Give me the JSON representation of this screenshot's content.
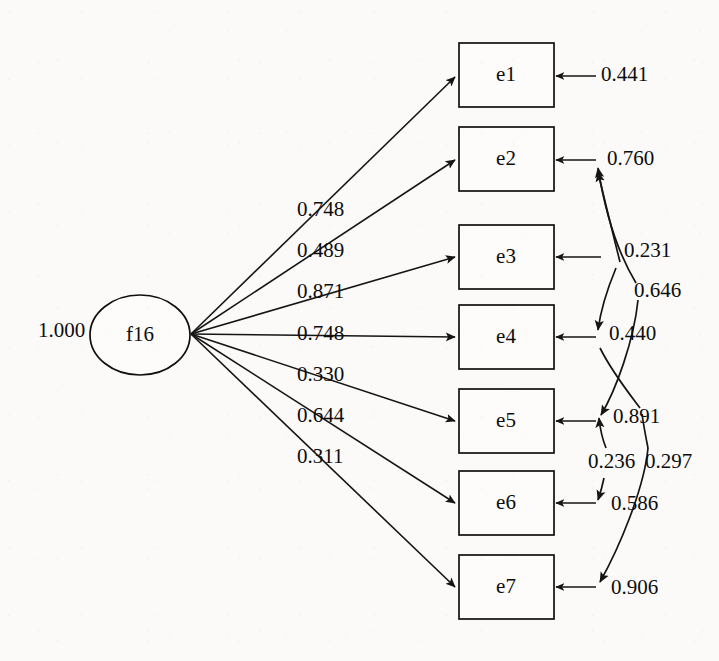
{
  "diagram": {
    "type": "sem-path-diagram",
    "title": "",
    "canvas": {
      "width": 719,
      "height": 661
    },
    "background_color": "#fbfaf8",
    "stroke_color": "#151515"
  },
  "latent": {
    "name": "f16",
    "shape": "ellipse",
    "cx": 140,
    "cy": 335,
    "rx": 50,
    "ry": 40,
    "variance_label": "1.000",
    "variance_label_x": 38,
    "variance_label_y": 332
  },
  "indicators": [
    {
      "name": "e1",
      "x": 459,
      "y": 43,
      "w": 95,
      "h": 64
    },
    {
      "name": "e2",
      "x": 459,
      "y": 127,
      "w": 95,
      "h": 64
    },
    {
      "name": "e3",
      "x": 459,
      "y": 225,
      "w": 95,
      "h": 64
    },
    {
      "name": "e4",
      "x": 459,
      "y": 305,
      "w": 95,
      "h": 64
    },
    {
      "name": "e5",
      "x": 459,
      "y": 389,
      "w": 95,
      "h": 64
    },
    {
      "name": "e6",
      "x": 459,
      "y": 471,
      "w": 95,
      "h": 64
    },
    {
      "name": "e7",
      "x": 459,
      "y": 555,
      "w": 95,
      "h": 64
    }
  ],
  "loadings": [
    {
      "target": "e1",
      "value": "0.748",
      "label_x": 297,
      "label_y": 211
    },
    {
      "target": "e2",
      "value": "0.489",
      "label_x": 297,
      "label_y": 252
    },
    {
      "target": "e3",
      "value": "0.871",
      "label_x": 297,
      "label_y": 293
    },
    {
      "target": "e4",
      "value": "0.748",
      "label_x": 297,
      "label_y": 335
    },
    {
      "target": "e5",
      "value": "0.330",
      "label_x": 297,
      "label_y": 376
    },
    {
      "target": "e6",
      "value": "0.644",
      "label_x": 297,
      "label_y": 417
    },
    {
      "target": "e7",
      "value": "0.311",
      "label_x": 297,
      "label_y": 458
    }
  ],
  "residuals": [
    {
      "target": "e1",
      "value": "0.441",
      "label_x": 601,
      "label_y": 76,
      "tail_x": 596
    },
    {
      "target": "e2",
      "value": "0.760",
      "label_x": 607,
      "label_y": 160,
      "tail_x": 596
    },
    {
      "target": "e3",
      "value": "0.231",
      "label_x": 624,
      "label_y": 252,
      "tail_x": 601
    },
    {
      "target": "e4",
      "value": "0.440",
      "label_x": 609,
      "label_y": 335,
      "tail_x": 596
    },
    {
      "target": "e5",
      "value": "0.891",
      "label_x": 613,
      "label_y": 418,
      "tail_x": 596
    },
    {
      "target": "e6",
      "value": "0.586",
      "label_x": 611,
      "label_y": 505,
      "tail_x": 596
    },
    {
      "target": "e7",
      "value": "0.906",
      "label_x": 611,
      "label_y": 589,
      "tail_x": 596
    }
  ],
  "correlations": [
    {
      "between": [
        "e2",
        "e4"
      ],
      "value": "0.646",
      "label_x": 634,
      "label_y": 292
    },
    {
      "between": [
        "e2",
        "e5"
      ],
      "value": "0.231",
      "label_x": 624,
      "label_y": 252
    },
    {
      "between": [
        "e4",
        "e5"
      ],
      "value": "0.236",
      "label_x": 592,
      "label_y": 463
    },
    {
      "between": [
        "e5",
        "e6"
      ],
      "value": "0.236",
      "label_x": 592,
      "label_y": 463
    },
    {
      "between": [
        "e5",
        "e7"
      ],
      "value": "0.297",
      "label_x": 648,
      "label_y": 463
    }
  ],
  "all_coefficient_values": [
    "1.000",
    "0.748",
    "0.489",
    "0.871",
    "0.748",
    "0.330",
    "0.644",
    "0.311",
    "0.441",
    "0.760",
    "0.231",
    "0.646",
    "0.440",
    "0.891",
    "0.236",
    "0.297",
    "0.586",
    "0.906"
  ]
}
